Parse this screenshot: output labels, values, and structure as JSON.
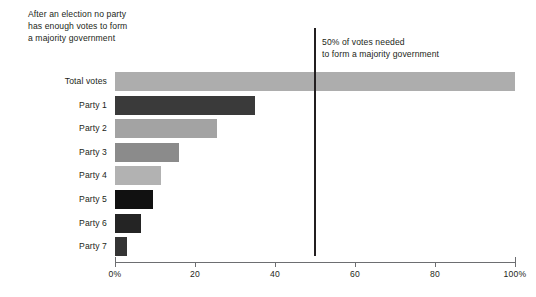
{
  "annotations": {
    "left": "After an election no party\nhas enough votes to form\na majority government",
    "right": "50% of votes needed\nto form a majority government"
  },
  "chart_data": {
    "type": "bar",
    "orientation": "horizontal",
    "title": "",
    "xlabel": "",
    "ylabel": "",
    "xlim": [
      0,
      100
    ],
    "grid": false,
    "legend": null,
    "categories": [
      "Total votes",
      "Party 1",
      "Party 2",
      "Party 3",
      "Party 4",
      "Party 5",
      "Party 6",
      "Party 7"
    ],
    "values": [
      100,
      35,
      25.5,
      16,
      11.5,
      9.5,
      6.5,
      3
    ],
    "bar_colors": [
      "#adadad",
      "#3a3a3a",
      "#a3a3a3",
      "#8b8b8b",
      "#b2b2b2",
      "#111111",
      "#242424",
      "#343434"
    ],
    "xticks": [
      0,
      20,
      40,
      60,
      80,
      100
    ],
    "xticklabels": [
      "0%",
      "20",
      "40",
      "60",
      "80",
      "100%"
    ],
    "annotation_line": {
      "value": 50,
      "label": "50% of votes needed to form a majority government",
      "color": "#231f20"
    }
  }
}
